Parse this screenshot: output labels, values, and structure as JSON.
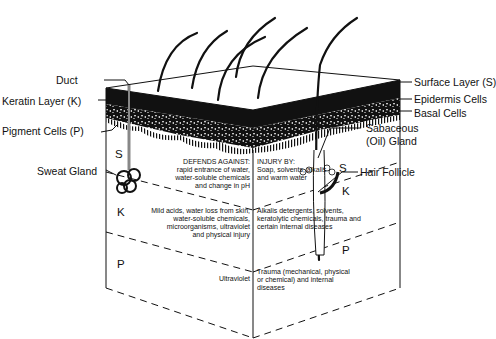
{
  "diagram": {
    "labels_left": {
      "duct": "Duct",
      "keratin_layer": "Keratin Layer (K)",
      "pigment_cells": "Pigment Cells (P)",
      "sweat_gland": "Sweat Gland"
    },
    "labels_right": {
      "surface_layer": "Surface Layer (S)",
      "epidermis_cells": "Epidermis Cells",
      "basal_cells": "Basal Cells",
      "sebaceous_1": "Sabaceous",
      "sebaceous_2": "(Oil) Gland",
      "hair_follicle": "Hair Follicle"
    },
    "layer_letters": {
      "front_s": "S",
      "front_k": "K",
      "front_p": "P",
      "side_s": "S",
      "side_k": "K",
      "side_p": "P"
    },
    "table": {
      "header_left": "DEFENDS AGAINST:",
      "header_right": "INJURY BY:",
      "rows": [
        {
          "layer": "S",
          "defends": [
            "rapid entrance of water,",
            "water-soluble chemicals",
            "and change in pH"
          ],
          "injury": [
            "Soap, solvents, alkalis",
            "and warm water"
          ]
        },
        {
          "layer": "K",
          "defends": [
            "Mild acids, water loss from skin,",
            "water-soluble chemicals,",
            "microorganisms, ultraviolet",
            "and physical injury"
          ],
          "injury": [
            "Alkalis detergents, solvents,",
            "keratolytic chemicals, trauma and",
            "certain internal diseases"
          ]
        },
        {
          "layer": "P",
          "defends": [
            "Ultraviolet"
          ],
          "injury": [
            "Trauma (mechanical, physical",
            "or chemical) and internal",
            "diseases"
          ]
        }
      ]
    },
    "colors": {
      "ink": "#111111",
      "background": "#ffffff"
    }
  }
}
